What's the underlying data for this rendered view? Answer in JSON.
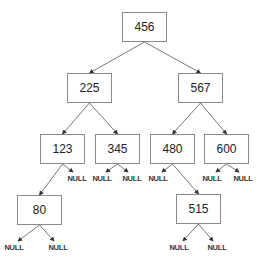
{
  "diagram": {
    "type": "binary-search-tree",
    "nodes": [
      {
        "id": "n456",
        "label": "456",
        "x": 122,
        "y": 12
      },
      {
        "id": "n225",
        "label": "225",
        "x": 67,
        "y": 73
      },
      {
        "id": "n567",
        "label": "567",
        "x": 178,
        "y": 73
      },
      {
        "id": "n123",
        "label": "123",
        "x": 40,
        "y": 134
      },
      {
        "id": "n345",
        "label": "345",
        "x": 95,
        "y": 134
      },
      {
        "id": "n480",
        "label": "480",
        "x": 150,
        "y": 134
      },
      {
        "id": "n600",
        "label": "600",
        "x": 204,
        "y": 134
      },
      {
        "id": "n80",
        "label": "80",
        "x": 17,
        "y": 195
      },
      {
        "id": "n515",
        "label": "515",
        "x": 176,
        "y": 194
      }
    ],
    "null_label": "NULL",
    "nulls": [
      {
        "parent": "n123",
        "side": "right",
        "x": 77,
        "y": 175
      },
      {
        "parent": "n345",
        "side": "left",
        "x": 102,
        "y": 175
      },
      {
        "parent": "n345",
        "side": "right",
        "x": 132,
        "y": 175
      },
      {
        "parent": "n480",
        "side": "left",
        "x": 158,
        "y": 175
      },
      {
        "parent": "n600",
        "side": "left",
        "x": 212,
        "y": 175
      },
      {
        "parent": "n600",
        "side": "right",
        "x": 243,
        "y": 175
      },
      {
        "parent": "n80",
        "side": "left",
        "x": 14,
        "y": 244
      },
      {
        "parent": "n80",
        "side": "right",
        "x": 58,
        "y": 244
      },
      {
        "parent": "n515",
        "side": "left",
        "x": 179,
        "y": 244
      },
      {
        "parent": "n515",
        "side": "right",
        "x": 217,
        "y": 244
      }
    ],
    "edges": [
      [
        "n456",
        "n225"
      ],
      [
        "n456",
        "n567"
      ],
      [
        "n225",
        "n123"
      ],
      [
        "n225",
        "n345"
      ],
      [
        "n567",
        "n480"
      ],
      [
        "n567",
        "n600"
      ],
      [
        "n123",
        "n80"
      ],
      [
        "n480",
        "n515"
      ]
    ],
    "colors": {
      "border": "#8a8a8a",
      "edge": "#444444",
      "text": "#222222"
    }
  }
}
